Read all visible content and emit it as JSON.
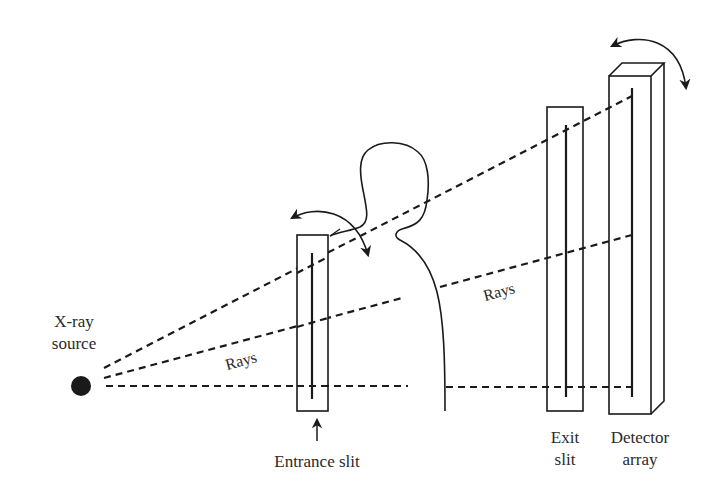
{
  "diagram": {
    "labels": {
      "source_line1": "X-ray",
      "source_line2": "source",
      "entrance_slit": "Entrance slit",
      "exit_slit_line1": "Exit",
      "exit_slit_line2": "slit",
      "detector_line1": "Detector",
      "detector_line2": "array",
      "rays_left": "Rays",
      "rays_right": "Rays"
    },
    "icons": {
      "source": "filled-circle",
      "entrance_rotation": "curved-double-arrow",
      "detector_rotation": "curved-double-arrow",
      "entrance_pointer": "up-arrow"
    },
    "colors": {
      "stroke": "#1a1a1a",
      "text": "#2a2a2a",
      "background": "#ffffff"
    }
  }
}
